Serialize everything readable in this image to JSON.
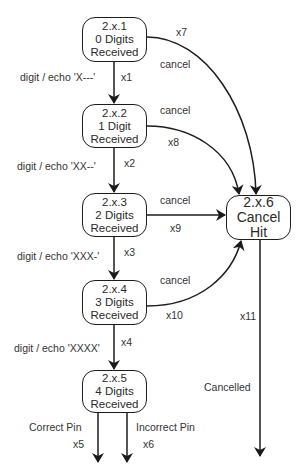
{
  "diagram": {
    "type": "state-machine",
    "states": [
      {
        "id": "2.x.1",
        "line1": "2.x.1",
        "line2": "0 Digits",
        "line3": "Received"
      },
      {
        "id": "2.x.2",
        "line1": "2.x.2",
        "line2": "1 Digit",
        "line3": "Received"
      },
      {
        "id": "2.x.3",
        "line1": "2.x.3",
        "line2": "2 Digits",
        "line3": "Received"
      },
      {
        "id": "2.x.4",
        "line1": "2.x.4",
        "line2": "3 Digits",
        "line3": "Received"
      },
      {
        "id": "2.x.5",
        "line1": "2.x.5",
        "line2": "4 Digits",
        "line3": "Received"
      },
      {
        "id": "2.x.6",
        "line1": "2.x.6",
        "line2": "Cancel",
        "line3": "Hit"
      }
    ],
    "transitions": [
      {
        "id": "x1",
        "from": "2.x.1",
        "to": "2.x.2",
        "label": "digit / echo 'X---'"
      },
      {
        "id": "x2",
        "from": "2.x.2",
        "to": "2.x.3",
        "label": "digit / echo 'XX--'"
      },
      {
        "id": "x3",
        "from": "2.x.3",
        "to": "2.x.4",
        "label": "digit / echo 'XXX-'"
      },
      {
        "id": "x4",
        "from": "2.x.4",
        "to": "2.x.5",
        "label": "digit / echo 'XXXX'"
      },
      {
        "id": "x5",
        "from": "2.x.5",
        "to": "exit",
        "label": "Correct Pin"
      },
      {
        "id": "x6",
        "from": "2.x.5",
        "to": "exit",
        "label": "Incorrect Pin"
      },
      {
        "id": "x7",
        "from": "2.x.1",
        "to": "2.x.6",
        "label": "cancel"
      },
      {
        "id": "x8",
        "from": "2.x.2",
        "to": "2.x.6",
        "label": "cancel"
      },
      {
        "id": "x9",
        "from": "2.x.3",
        "to": "2.x.6",
        "label": "cancel"
      },
      {
        "id": "x10",
        "from": "2.x.4",
        "to": "2.x.6",
        "label": "cancel"
      },
      {
        "id": "x11",
        "from": "2.x.6",
        "to": "exit",
        "label": "Cancelled"
      }
    ]
  }
}
